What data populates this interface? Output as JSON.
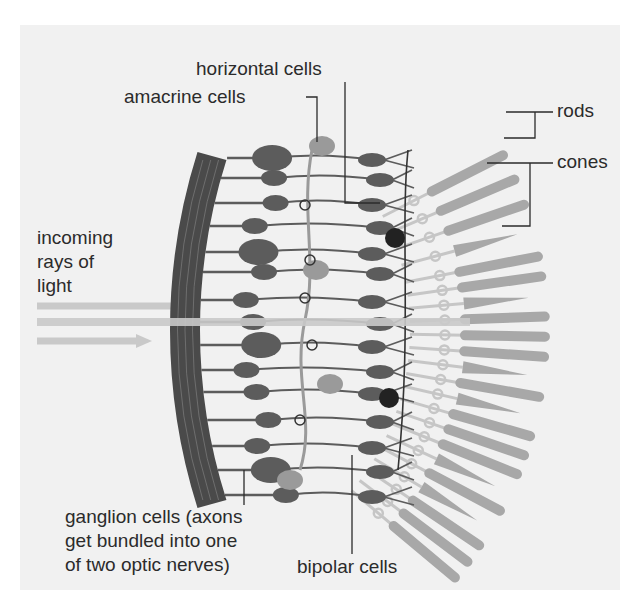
{
  "figure": {
    "colors": {
      "background": "#ffffff",
      "panel": "#f1f1f1",
      "wall": "#4a4a4a",
      "neuron": "#5c5c5c",
      "neuron_light": "#9a9a9a",
      "photoreceptor": "#a8a8a8",
      "photoreceptor_stalk": "#c6c6c6",
      "light_ray": "#c9c9c9",
      "leader_line": "#2b2b2b",
      "label_text": "#2b2b2b"
    },
    "labels": {
      "horizontal_cells": "horizontal cells",
      "amacrine_cells": "amacrine cells",
      "rods": "rods",
      "cones": "cones",
      "incoming_light": [
        "incoming",
        "rays of",
        "light"
      ],
      "ganglion_cells": [
        "ganglion cells (axons",
        "get bundled into one",
        "of two optic nerves)"
      ],
      "bipolar_cells": "bipolar cells"
    }
  },
  "geometry": {
    "wall": {
      "cx": 760,
      "cy": 330,
      "r_outer": 590,
      "r_inner": 560,
      "angle_start": 197,
      "angle_end": 161
    },
    "ganglion_rows": [
      158,
      178,
      203,
      226,
      252,
      272,
      300,
      322,
      345,
      370,
      392,
      420,
      446,
      470,
      495
    ],
    "photoreceptors": [
      {
        "type": "rod",
        "angle": -27
      },
      {
        "type": "rod",
        "angle": -23
      },
      {
        "type": "rod",
        "angle": -19
      },
      {
        "type": "cone",
        "angle": -15
      },
      {
        "type": "rod",
        "angle": -11
      },
      {
        "type": "rod",
        "angle": -8
      },
      {
        "type": "cone",
        "angle": -5
      },
      {
        "type": "rod",
        "angle": -2
      },
      {
        "type": "rod",
        "angle": 1
      },
      {
        "type": "rod",
        "angle": 4
      },
      {
        "type": "cone",
        "angle": 7
      },
      {
        "type": "rod",
        "angle": 10
      },
      {
        "type": "cone",
        "angle": 13
      },
      {
        "type": "rod",
        "angle": 16
      },
      {
        "type": "rod",
        "angle": 19
      },
      {
        "type": "rod",
        "angle": 22
      },
      {
        "type": "cone",
        "angle": 25
      },
      {
        "type": "rod",
        "angle": 28
      },
      {
        "type": "cone",
        "angle": 31
      },
      {
        "type": "rod",
        "angle": 34
      },
      {
        "type": "rod",
        "angle": 37
      },
      {
        "type": "rod",
        "angle": 40
      }
    ],
    "light_rays": [
      {
        "y": 306,
        "x1": 37,
        "x2": 195
      },
      {
        "y": 322,
        "x1": 37,
        "x2": 470
      },
      {
        "y": 341,
        "x1": 37,
        "x2": 152
      }
    ]
  }
}
